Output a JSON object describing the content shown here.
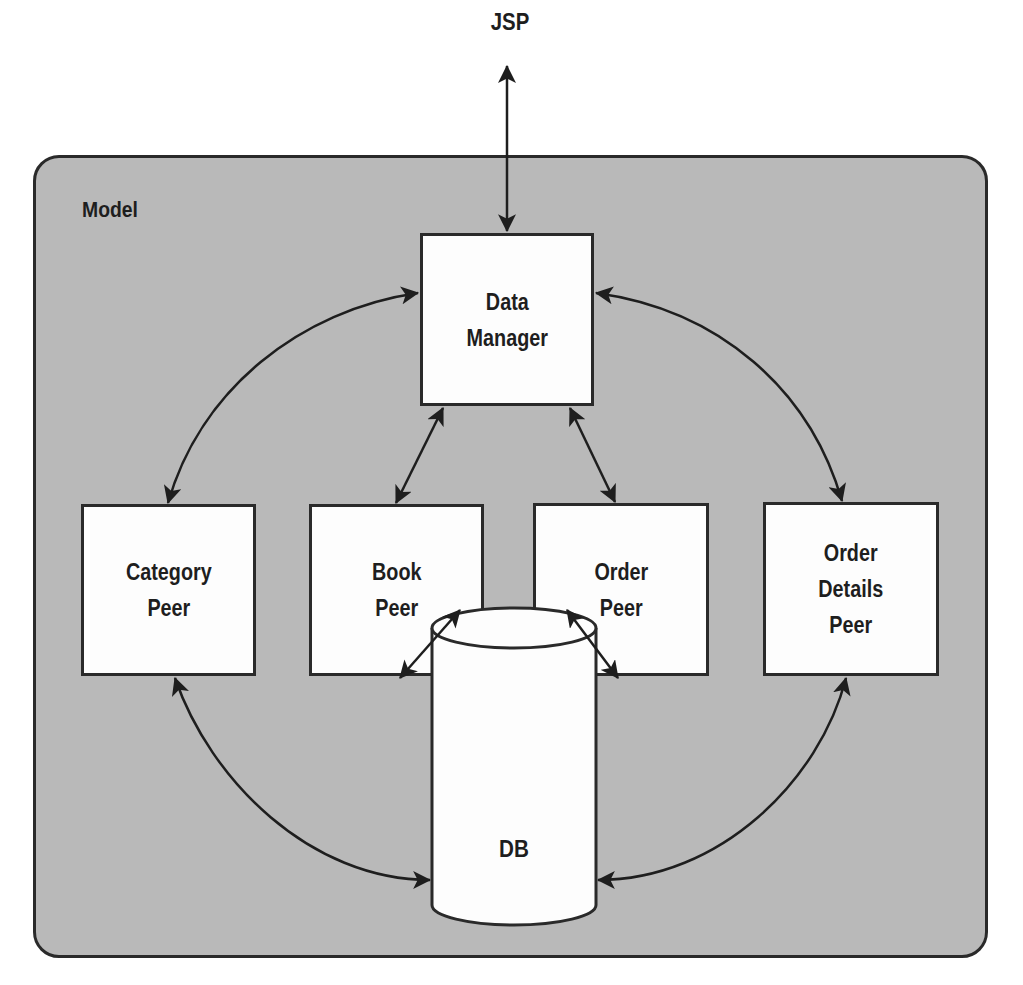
{
  "diagram": {
    "external": {
      "jsp": "JSP"
    },
    "container": {
      "label": "Model"
    },
    "nodes": {
      "data_manager": "Data\nManager",
      "category_peer": "Category\nPeer",
      "book_peer": "Book\nPeer",
      "order_peer": "Order\nPeer",
      "order_details_peer": "Order\nDetails\nPeer",
      "db": "DB"
    },
    "edges": [
      {
        "from": "JSP",
        "to": "Data Manager",
        "direction": "bidirectional"
      },
      {
        "from": "Data Manager",
        "to": "Category Peer",
        "direction": "bidirectional"
      },
      {
        "from": "Data Manager",
        "to": "Book Peer",
        "direction": "bidirectional"
      },
      {
        "from": "Data Manager",
        "to": "Order Peer",
        "direction": "bidirectional"
      },
      {
        "from": "Data Manager",
        "to": "Order Details Peer",
        "direction": "bidirectional"
      },
      {
        "from": "Category Peer",
        "to": "DB",
        "direction": "bidirectional"
      },
      {
        "from": "Book Peer",
        "to": "DB",
        "direction": "bidirectional"
      },
      {
        "from": "Order Peer",
        "to": "DB",
        "direction": "bidirectional"
      },
      {
        "from": "Order Details Peer",
        "to": "DB",
        "direction": "bidirectional"
      }
    ],
    "colors": {
      "container_fill": "#b9b9b9",
      "stroke": "#2a2a2a",
      "node_fill": "#fdfdfd",
      "text": "#1e1e1e"
    }
  }
}
